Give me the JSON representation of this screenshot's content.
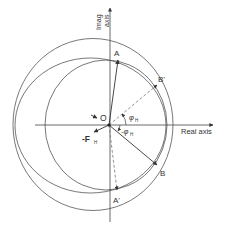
{
  "diagram": {
    "axes": {
      "imag_axis_label_line1": "Imag",
      "imag_axis_label_line2": "axis",
      "real_axis_label": "Real axis"
    },
    "points": {
      "origin": "O",
      "A": "A",
      "A_prime": "A'",
      "B": "B",
      "B_prime": "B'"
    },
    "angles": {
      "phi_pos": "φ",
      "phi_pos_sub": "H",
      "phi_neg": "-φ",
      "phi_neg_sub": "H"
    },
    "force": {
      "label": "-F",
      "sub": "H"
    },
    "colors": {
      "stroke": "#444444",
      "dashed": "#777777",
      "text": "#333333"
    }
  }
}
